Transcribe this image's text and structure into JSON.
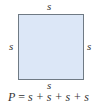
{
  "diagram": {
    "shape": "square",
    "fill_color": "#dce7f7",
    "border_color": "#6f7a84",
    "labels": {
      "top": "s",
      "left": "s",
      "right": "s",
      "bottom": "s"
    },
    "formula": {
      "lhs": "P",
      "equals": "=",
      "rhs": "s + s + s + s"
    }
  }
}
